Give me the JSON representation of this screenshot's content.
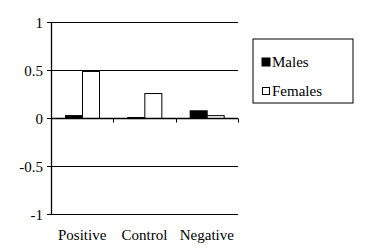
{
  "chart_data": {
    "type": "bar",
    "title": "",
    "xlabel": "",
    "ylabel": "",
    "categories": [
      "Positive",
      "Control",
      "Negative"
    ],
    "series": [
      {
        "name": "Males",
        "values": [
          0.03,
          0.01,
          0.08
        ],
        "fill": "#000000"
      },
      {
        "name": "Females",
        "values": [
          0.49,
          0.26,
          0.03
        ],
        "fill": "#ffffff"
      }
    ],
    "ylim": [
      -1,
      1
    ],
    "yticks": [
      1,
      0.5,
      0,
      -0.5,
      -1
    ],
    "ytick_labels": [
      "1",
      "0.5",
      "0",
      "-0.5",
      "-1"
    ],
    "grid": true,
    "legend_position": "right"
  },
  "legend": {
    "items": [
      {
        "label": "Males"
      },
      {
        "label": "Females"
      }
    ]
  }
}
